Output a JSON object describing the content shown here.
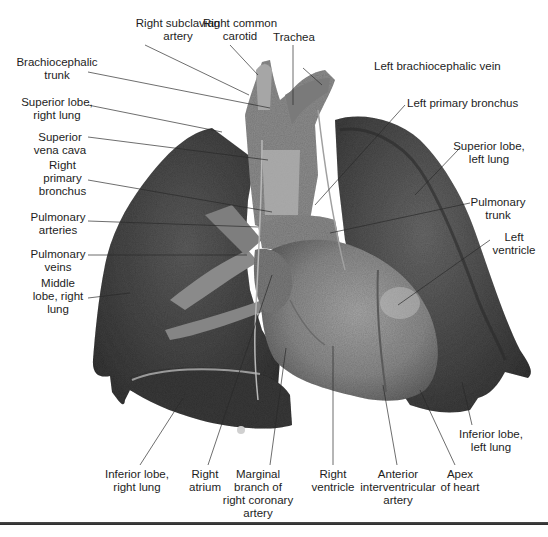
{
  "figure": {
    "colors": {
      "background": "#ffffff",
      "lung_dark": "#3c3c3c",
      "lung_mid": "#595959",
      "heart": "#8c8c8c",
      "vessels": "#9a9a9a",
      "leader_line": "#2a2a2a",
      "rule": "#333333"
    },
    "labels": [
      {
        "id": "right-subclavian-artery",
        "text": "Right subclavian\nartery",
        "x": 178,
        "y": 17,
        "tx": 249,
        "ty": 95
      },
      {
        "id": "right-common-carotid",
        "text": "Right common\ncarotid",
        "x": 240,
        "y": 17,
        "tx": 258,
        "ty": 75
      },
      {
        "id": "trachea",
        "text": "Trachea",
        "x": 293,
        "y": 31,
        "tx": 293,
        "ty": 105
      },
      {
        "id": "left-brachiocephalic-vein",
        "text": "Left brachiocephalic vein",
        "x": 375,
        "y": 60,
        "tx": 322,
        "ty": 85
      },
      {
        "id": "brachiocephalic-trunk",
        "text": "Brachiocephalic\ntrunk",
        "x": 57,
        "y": 56,
        "tx": 270,
        "ty": 108
      },
      {
        "id": "left-primary-bronchus",
        "text": "Left primary bronchus",
        "x": 408,
        "y": 97,
        "tx": 315,
        "ty": 205
      },
      {
        "id": "superior-lobe-right-lung",
        "text": "Superior lobe,\nright lung",
        "x": 57,
        "y": 96,
        "tx": 222,
        "ty": 132
      },
      {
        "id": "superior-vena-cava",
        "text": "Superior\nvena cava",
        "x": 60,
        "y": 131,
        "tx": 268,
        "ty": 160
      },
      {
        "id": "superior-lobe-left-lung",
        "text": "Superior lobe,\nleft lung",
        "x": 488,
        "y": 140,
        "tx": 415,
        "ty": 195
      },
      {
        "id": "right-primary-bronchus",
        "text": "Right\nprimary\nbronchus",
        "x": 62,
        "y": 159,
        "tx": 272,
        "ty": 212
      },
      {
        "id": "pulmonary-trunk",
        "text": "Pulmonary\ntrunk",
        "x": 498,
        "y": 196,
        "tx": 330,
        "ty": 233
      },
      {
        "id": "pulmonary-arteries",
        "text": "Pulmonary\narteries",
        "x": 58,
        "y": 211,
        "tx": 258,
        "ty": 227
      },
      {
        "id": "left-ventricle",
        "text": "Left\nventricle",
        "x": 514,
        "y": 231,
        "tx": 398,
        "ty": 305
      },
      {
        "id": "pulmonary-veins",
        "text": "Pulmonary\nveins",
        "x": 58,
        "y": 248,
        "tx": 247,
        "ty": 255
      },
      {
        "id": "middle-lobe-right-lung",
        "text": "Middle\nlobe, right\nlung",
        "x": 58,
        "y": 277,
        "tx": 130,
        "ty": 293
      },
      {
        "id": "inferior-lobe-left-lung",
        "text": "Inferior lobe,\nleft lung",
        "x": 491,
        "y": 428,
        "tx": 462,
        "ty": 382
      },
      {
        "id": "inferior-lobe-right-lung",
        "text": "Inferior lobe,\nright lung",
        "x": 137,
        "y": 468,
        "tx": 183,
        "ty": 398
      },
      {
        "id": "right-atrium",
        "text": "Right\natrium",
        "x": 205,
        "y": 468,
        "tx": 272,
        "ty": 275
      },
      {
        "id": "marginal-branch",
        "text": "Marginal\nbranch of\nright coronary\nartery",
        "x": 258,
        "y": 468,
        "tx": 286,
        "ty": 348
      },
      {
        "id": "right-ventricle",
        "text": "Right\nventricle",
        "x": 333,
        "y": 468,
        "tx": 333,
        "ty": 346
      },
      {
        "id": "anterior-interventricular-artery",
        "text": "Anterior\ninterventricular\nartery",
        "x": 397,
        "y": 468,
        "tx": 383,
        "ty": 385
      },
      {
        "id": "apex-of-heart",
        "text": "Apex\nof heart",
        "x": 460,
        "y": 468,
        "tx": 420,
        "ty": 390
      }
    ]
  }
}
